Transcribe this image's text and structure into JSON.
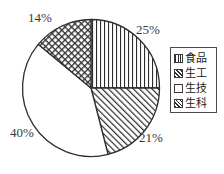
{
  "chart_data": {
    "type": "pie",
    "title": "",
    "categories": [
      "食品",
      "生工",
      "生技",
      "生科"
    ],
    "values": [
      25,
      21,
      40,
      14
    ],
    "value_unit": "%",
    "data_labels": [
      "25%",
      "21%",
      "40%",
      "14%"
    ],
    "legend_position": "right",
    "grid": false,
    "start_angle_deg": 0,
    "direction": "clockwise",
    "slice_patterns": [
      "vertical-lines",
      "diagonal-hatch",
      "blank",
      "cross-hatch"
    ],
    "stroke_color": "#2e2e2e",
    "background_color": "#ffffff"
  },
  "pie": {
    "slices": [
      {
        "name": "食品",
        "percent_label": "25%",
        "value": 25,
        "pattern": "vertical-lines",
        "label_x": 136,
        "label_y": 23
      },
      {
        "name": "生工",
        "percent_label": "21%",
        "value": 21,
        "pattern": "diagonal-hatch",
        "label_x": 139,
        "label_y": 131
      },
      {
        "name": "生技",
        "percent_label": "40%",
        "value": 40,
        "pattern": "blank",
        "label_x": 10,
        "label_y": 126
      },
      {
        "name": "生科",
        "percent_label": "14%",
        "value": 14,
        "pattern": "cross-hatch",
        "label_x": 28,
        "label_y": 11
      }
    ]
  },
  "legend": {
    "items": [
      {
        "label": "食品",
        "pattern": "vertical-lines"
      },
      {
        "label": "生工",
        "pattern": "diagonal-hatch"
      },
      {
        "label": "生技",
        "pattern": "blank"
      },
      {
        "label": "生科",
        "pattern": "cross-hatch"
      }
    ]
  }
}
